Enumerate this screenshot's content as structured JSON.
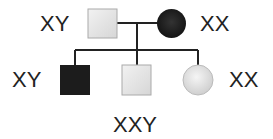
{
  "diagram": {
    "type": "pedigree",
    "colors": {
      "affected": "#1a1a1a",
      "unaffected_fill": "#e6e6e6",
      "unaffected_stroke": "#999999",
      "line": "#222222"
    },
    "parents": {
      "father": {
        "label": "XY",
        "sex": "male",
        "affected": false
      },
      "mother": {
        "label": "XX",
        "sex": "female",
        "affected": true
      }
    },
    "children": [
      {
        "label": "XY",
        "sex": "male",
        "affected": true
      },
      {
        "label": "XXY",
        "sex": "male",
        "affected": false
      },
      {
        "label": "XX",
        "sex": "female",
        "affected": false
      }
    ]
  }
}
